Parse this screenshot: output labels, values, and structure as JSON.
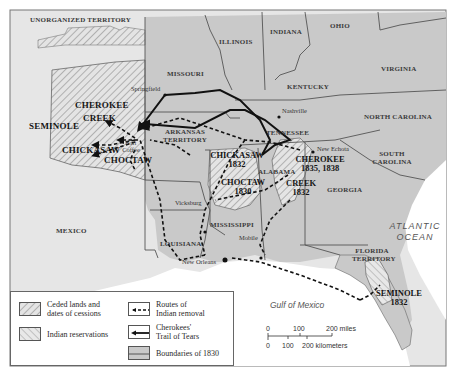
{
  "map": {
    "colors": {
      "us_land": "#c9c9c9",
      "foreign_land": "#e6e6e6",
      "water": "#ffffff",
      "border": "#555555",
      "route": "#111111"
    },
    "regions": {
      "unorganized_territory": "UNORGANIZED TERRITORY",
      "illinois": "ILLINOIS",
      "indiana": "INDIANA",
      "ohio": "OHIO",
      "missouri": "MISSOURI",
      "kentucky": "KENTUCKY",
      "virginia": "VIRGINIA",
      "north_carolina": "NORTH CAROLINA",
      "tennessee": "TENNESSEE",
      "south_carolina": "SOUTH CAROLINA",
      "arkansas_territory": "ARKANSAS TERRITORY",
      "alabama": "ALABAMA",
      "georgia": "GEORGIA",
      "mississippi": "MISSISSIPPI",
      "louisiana": "LOUISIANA",
      "mexico": "MEXICO",
      "florida_territory": "FLORIDA TERRITORY"
    },
    "cities": {
      "springfield": "Springfield",
      "nashville": "Nashville",
      "new_echota": "New Echota",
      "fort_coffee": "Fort Coffee",
      "vicksburg": "Vicksburg",
      "mobile": "Mobile",
      "new_orleans": "New Orleans"
    },
    "tribes": {
      "cherokee_west": "CHEROKEE",
      "creek_west": "CREEK",
      "seminole_west": "SEMINOLE",
      "chickasaw_west": "CHICKASAW",
      "choctaw_west": "CHOCTAW",
      "chickasaw_east": {
        "name": "CHICKASAW",
        "date": "1832"
      },
      "choctaw_east": {
        "name": "CHOCTAW",
        "date": "1830"
      },
      "cherokee_east": {
        "name": "CHEROKEE",
        "date": "1835, 1838"
      },
      "creek_east": {
        "name": "CREEK",
        "date": "1832"
      },
      "seminole_east": {
        "name": "SEMINOLE",
        "date": "1832"
      }
    },
    "water": {
      "atlantic_line1": "ATLANTIC",
      "atlantic_line2": "OCEAN",
      "gulf": "Gulf of Mexico"
    },
    "scale": {
      "miles": [
        "0",
        "100",
        "200 miles"
      ],
      "km": [
        "0",
        "100",
        "200 kilometers"
      ]
    }
  },
  "legend": {
    "ceded": {
      "line1": "Ceded lands and",
      "line2": "dates of cessions"
    },
    "reservations": "Indian reservations",
    "routes": {
      "line1": "Routes of",
      "line2": "Indian removal"
    },
    "trail": {
      "line1": "Cherokees'",
      "line2": "Trail of Tears"
    },
    "boundaries": "Boundaries of 1830"
  }
}
